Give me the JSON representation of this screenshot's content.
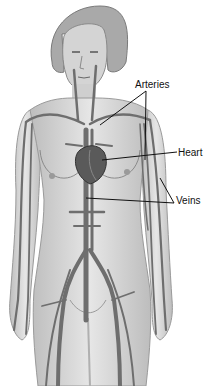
{
  "figure": {
    "labels": [
      {
        "id": "arteries",
        "text": "Arteries",
        "x": 135,
        "y": 80
      },
      {
        "id": "heart",
        "text": "Heart",
        "x": 178,
        "y": 148
      },
      {
        "id": "veins",
        "text": "Veins",
        "x": 176,
        "y": 196
      }
    ],
    "colors": {
      "skin": "#d9d9d9",
      "skin_shadow": "#b8b8b8",
      "hair": "#a9a9a9",
      "vessel": "#6e6e6e",
      "heart": "#5a5a5a",
      "leader_line": "#111111",
      "background": "#ffffff"
    }
  }
}
